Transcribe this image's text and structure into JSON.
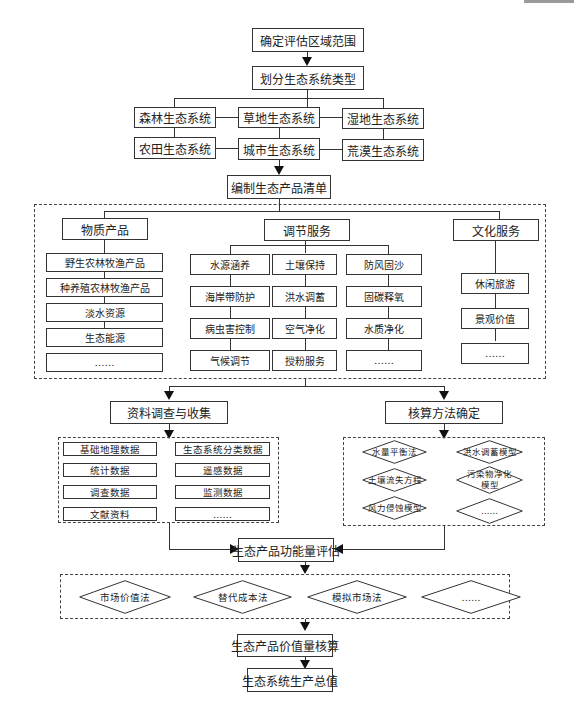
{
  "flowchart": {
    "step1": "确定评估区域范围",
    "step2": "划分生态系统类型",
    "ecosystems": [
      "森林生态系统",
      "草地生态系统",
      "湿地生态系统",
      "农田生态系统",
      "城市生态系统",
      "荒漠生态系统"
    ],
    "step3": "编制生态产品清单",
    "categories": {
      "material": {
        "title": "物质产品",
        "items": [
          "野生农林牧渔产品",
          "种养殖农林牧渔产品",
          "淡水资源",
          "生态能源",
          "……"
        ]
      },
      "regulating": {
        "title": "调节服务",
        "col1": [
          "水源涵养",
          "海岸带防护",
          "病虫害控制",
          "气候调节"
        ],
        "col2": [
          "土壤保持",
          "洪水调蓄",
          "空气净化",
          "授粉服务"
        ],
        "col3": [
          "防风固沙",
          "固碳释氧",
          "水质净化",
          "……"
        ]
      },
      "cultural": {
        "title": "文化服务",
        "items": [
          "休闲旅游",
          "景观价值",
          "……"
        ]
      }
    },
    "data_collection": {
      "title": "资料调查与收集",
      "left": [
        "基础地理数据",
        "统计数据",
        "调查数据",
        "文献资料"
      ],
      "right": [
        "生态系统分类数据",
        "遥感数据",
        "监测数据",
        "……"
      ]
    },
    "accounting_methods": {
      "title": "核算方法确定",
      "left": [
        "水量平衡法",
        "土壤流失方程",
        "风力侵蚀模型"
      ],
      "right": [
        "洪水调蓄模型",
        "污染物净化\n模型",
        "……"
      ]
    },
    "step_function": "生态产品功能量评估",
    "valuation_methods": [
      "市场价值法",
      "替代成本法",
      "模拟市场法",
      "……"
    ],
    "step_value": "生态产品价值量核算",
    "final": "生态系统生产总值"
  }
}
